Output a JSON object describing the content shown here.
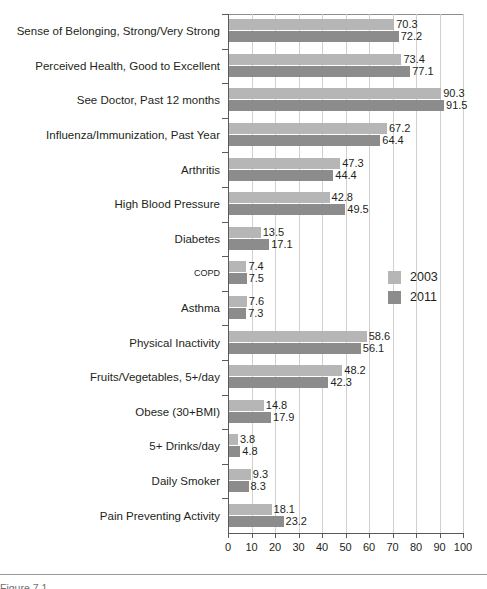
{
  "chart_data": {
    "type": "bar",
    "orientation": "horizontal",
    "title": "",
    "xlabel": "",
    "ylabel": "",
    "xlim": [
      0,
      100
    ],
    "xticks": [
      0,
      10,
      20,
      30,
      40,
      50,
      60,
      70,
      80,
      90,
      100
    ],
    "grid": true,
    "legend_position": "middle-right",
    "categories": [
      "Sense of Belonging, Strong/Very Strong",
      "Perceived Health, Good to Excellent",
      "See Doctor, Past 12 months",
      "Influenza/Immunization, Past Year",
      "Arthritis",
      "High Blood Pressure",
      "Diabetes",
      "COPD",
      "Asthma",
      "Physical Inactivity",
      "Fruits/Vegetables, 5+/day",
      "Obese (30+BMI)",
      "5+ Drinks/day",
      "Daily Smoker",
      "Pain Preventing Activity"
    ],
    "series": [
      {
        "name": "2003",
        "color": "#b6b6b6",
        "values": [
          70.3,
          73.4,
          90.3,
          67.2,
          47.3,
          42.8,
          13.5,
          7.4,
          7.6,
          58.6,
          48.2,
          14.8,
          3.8,
          9.3,
          18.1
        ]
      },
      {
        "name": "2011",
        "color": "#8c8c8c",
        "values": [
          72.2,
          77.1,
          91.5,
          64.4,
          44.4,
          49.5,
          17.1,
          7.5,
          7.3,
          56.1,
          42.3,
          17.9,
          4.8,
          8.3,
          23.2
        ]
      }
    ]
  },
  "legend": {
    "items": [
      {
        "label": "2003",
        "color": "#b6b6b6"
      },
      {
        "label": "2011",
        "color": "#8c8c8c"
      }
    ]
  },
  "caption": {
    "text": "Figure 7.1"
  }
}
